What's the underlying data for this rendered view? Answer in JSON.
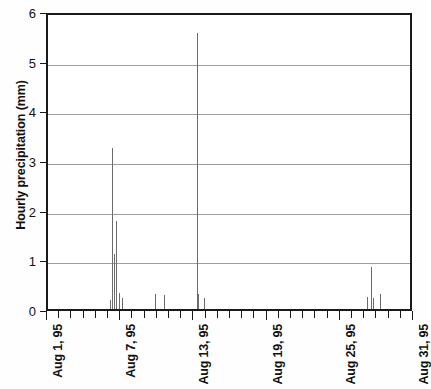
{
  "chart_data": {
    "type": "bar",
    "title": "",
    "subtitle": "",
    "xlabel": "",
    "ylabel": "Hourly precipitation (mm)",
    "ylim": [
      0,
      6
    ],
    "yticks": [
      0,
      1,
      2,
      3,
      4,
      5,
      6
    ],
    "ytick_labels": [
      "0",
      "1",
      "2",
      "3",
      "4",
      "5",
      "6"
    ],
    "grid": "horizontal",
    "legend": "none",
    "xlim_days": [
      1,
      31
    ],
    "xtick_labels": [
      "Aug 1, 95",
      "Aug 7, 95",
      "Aug 13, 95",
      "Aug 19, 95",
      "Aug 25, 95",
      "Aug 31, 95"
    ],
    "xtick_days": [
      1,
      7,
      13,
      19,
      25,
      31
    ],
    "xtick_minor_interval_days": 1,
    "x_unit": "date (August 1995)",
    "y_unit": "mm",
    "series_name": "Hourly precipitation",
    "bar_color": "#6b6b6b",
    "axis_color": "#1a1a1a",
    "grid_color": "#9d9d9d",
    "background_color": "#ffffff",
    "points": [
      {
        "day": 6.05,
        "value": 0.18
      },
      {
        "day": 6.25,
        "value": 3.25
      },
      {
        "day": 6.4,
        "value": 1.1
      },
      {
        "day": 6.6,
        "value": 1.78
      },
      {
        "day": 6.8,
        "value": 0.32
      },
      {
        "day": 7.05,
        "value": 0.22
      },
      {
        "day": 9.75,
        "value": 0.3
      },
      {
        "day": 10.5,
        "value": 0.28
      },
      {
        "day": 13.25,
        "value": 5.55
      },
      {
        "day": 13.3,
        "value": 0.3
      },
      {
        "day": 13.75,
        "value": 0.22
      },
      {
        "day": 27.15,
        "value": 0.25
      },
      {
        "day": 27.45,
        "value": 0.85
      },
      {
        "day": 27.6,
        "value": 0.22
      },
      {
        "day": 28.2,
        "value": 0.3
      }
    ]
  }
}
